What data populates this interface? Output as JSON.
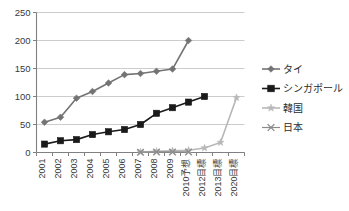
{
  "chart_data": {
    "type": "line",
    "title": "",
    "xlabel": "",
    "ylabel": "",
    "ylim": [
      0,
      250
    ],
    "yticks": [
      0,
      50,
      100,
      150,
      200,
      250
    ],
    "grid": "horizontal",
    "legend_position": "right",
    "categories": [
      "2001",
      "2002",
      "2003",
      "2004",
      "2005",
      "2006",
      "2007",
      "2008",
      "2009",
      "2010予想",
      "2012目標",
      "2013目標",
      "2020目標"
    ],
    "series": [
      {
        "name": "タイ",
        "marker": "diamond",
        "color": "#737373",
        "values": [
          54,
          63,
          97,
          109,
          124,
          139,
          141,
          145,
          149,
          200,
          null,
          null,
          null
        ]
      },
      {
        "name": "シンガポール",
        "marker": "square",
        "color": "#1a1a1a",
        "values": [
          15,
          21,
          23,
          32,
          37,
          41,
          50,
          70,
          80,
          90,
          100,
          null,
          null
        ]
      },
      {
        "name": "韓国",
        "marker": "star",
        "color": "#b8b8b8",
        "values": [
          null,
          null,
          null,
          null,
          null,
          null,
          1,
          2,
          3,
          4,
          8,
          18,
          98
        ]
      },
      {
        "name": "日本",
        "marker": "cross",
        "color": "#8c8c8c",
        "values": [
          null,
          null,
          null,
          null,
          null,
          null,
          0.5,
          1,
          1,
          1,
          null,
          null,
          null
        ]
      }
    ]
  },
  "axis": {
    "ytick_labels": [
      "250",
      "200",
      "150",
      "100",
      "50",
      "0"
    ]
  },
  "legend": {
    "items": [
      {
        "label": "タイ",
        "marker": "diamond",
        "color": "#737373"
      },
      {
        "label": "シンガポール",
        "marker": "square",
        "color": "#1a1a1a"
      },
      {
        "label": "韓国",
        "marker": "star",
        "color": "#b8b8b8"
      },
      {
        "label": "日本",
        "marker": "cross",
        "color": "#8c8c8c"
      }
    ]
  },
  "colors": {
    "grid": "#bfbfbf",
    "axis": "#808080",
    "text": "#3a3a3a",
    "background": "#ffffff"
  }
}
